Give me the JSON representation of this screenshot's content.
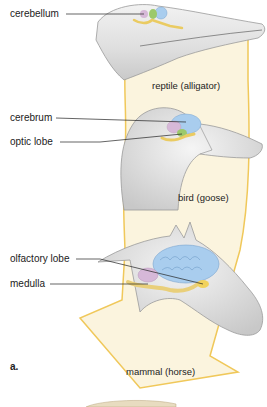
{
  "figure": {
    "panel_letter": "a.",
    "colors": {
      "arrow_fill": "#fbf4de",
      "arrow_stroke": "#f0c85a",
      "cerebrum": "#a9cdee",
      "cerebellum": "#d6b8d8",
      "optic_lobe": "#9cc96b",
      "olfactory_lobe": "#f1d25c",
      "medulla": "#e9cf7a",
      "skin": "#e6e6e6"
    },
    "animals": [
      {
        "caption": "reptile (alligator)",
        "labels": [
          "cerebellum"
        ]
      },
      {
        "caption": "bird (goose)",
        "labels": [
          "cerebrum",
          "optic lobe"
        ]
      },
      {
        "caption": "mammal (horse)",
        "labels": [
          "olfactory lobe",
          "medulla"
        ]
      }
    ]
  }
}
